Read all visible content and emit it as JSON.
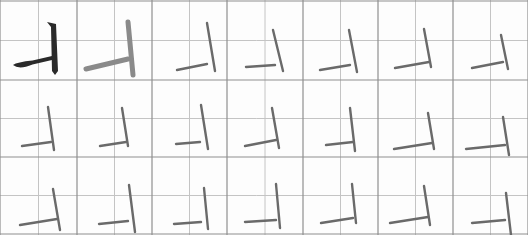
{
  "sheet": {
    "title": "Calligraphy stroke practice grid",
    "rows": 3,
    "cols": 7,
    "col_edges": [
      0,
      77,
      152,
      227,
      303,
      378,
      453,
      528
    ],
    "row_edges": [
      1,
      80,
      157,
      234
    ],
    "colors": {
      "grid_major": "#8f8f8f",
      "grid_minor": "#c4c4c4",
      "model_ink": "#2a2a2a",
      "trace_ink": "#8a8a8a",
      "practice_ink": "#6a6a6a"
    }
  },
  "cells": [
    {
      "row": 0,
      "col": 0,
      "kind": "model",
      "h": [
        [
          13,
          65
        ],
        [
          52,
          58
        ]
      ],
      "v": [
        [
          50,
          22
        ],
        [
          57,
          75
        ]
      ]
    },
    {
      "row": 0,
      "col": 1,
      "kind": "trace",
      "h": [
        [
          86,
          69
        ],
        [
          128,
          59
        ]
      ],
      "v": [
        [
          128,
          22
        ],
        [
          133,
          75
        ]
      ]
    },
    {
      "row": 0,
      "col": 2,
      "kind": "practice",
      "h": [
        [
          177,
          70
        ],
        [
          207,
          64
        ]
      ],
      "v": [
        [
          207,
          23
        ],
        [
          215,
          71
        ]
      ]
    },
    {
      "row": 0,
      "col": 3,
      "kind": "practice",
      "h": [
        [
          246,
          67
        ],
        [
          275,
          65
        ]
      ],
      "v": [
        [
          273,
          30
        ],
        [
          283,
          71
        ]
      ]
    },
    {
      "row": 0,
      "col": 4,
      "kind": "practice",
      "h": [
        [
          320,
          70
        ],
        [
          350,
          65
        ]
      ],
      "v": [
        [
          349,
          30
        ],
        [
          357,
          72
        ]
      ]
    },
    {
      "row": 0,
      "col": 5,
      "kind": "practice",
      "h": [
        [
          395,
          68
        ],
        [
          429,
          62
        ]
      ],
      "v": [
        [
          424,
          29
        ],
        [
          431,
          67
        ]
      ]
    },
    {
      "row": 0,
      "col": 6,
      "kind": "practice",
      "h": [
        [
          472,
          68
        ],
        [
          503,
          62
        ]
      ],
      "v": [
        [
          501,
          35
        ],
        [
          508,
          69
        ]
      ]
    },
    {
      "row": 1,
      "col": 0,
      "kind": "practice",
      "h": [
        [
          22,
          146
        ],
        [
          51,
          142
        ]
      ],
      "v": [
        [
          48,
          107
        ],
        [
          54,
          150
        ]
      ]
    },
    {
      "row": 1,
      "col": 1,
      "kind": "practice",
      "h": [
        [
          100,
          146
        ],
        [
          126,
          142
        ]
      ],
      "v": [
        [
          122,
          108
        ],
        [
          128,
          146
        ]
      ]
    },
    {
      "row": 1,
      "col": 2,
      "kind": "practice",
      "h": [
        [
          176,
          144
        ],
        [
          200,
          142
        ]
      ],
      "v": [
        [
          201,
          105
        ],
        [
          208,
          149
        ]
      ]
    },
    {
      "row": 1,
      "col": 3,
      "kind": "practice",
      "h": [
        [
          245,
          146
        ],
        [
          276,
          140
        ]
      ],
      "v": [
        [
          272,
          108
        ],
        [
          279,
          148
        ]
      ]
    },
    {
      "row": 1,
      "col": 4,
      "kind": "practice",
      "h": [
        [
          326,
          145
        ],
        [
          353,
          142
        ]
      ],
      "v": [
        [
          350,
          108
        ],
        [
          355,
          151
        ]
      ]
    },
    {
      "row": 1,
      "col": 5,
      "kind": "practice",
      "h": [
        [
          394,
          149
        ],
        [
          432,
          143
        ]
      ],
      "v": [
        [
          428,
          113
        ],
        [
          434,
          149
        ]
      ]
    },
    {
      "row": 1,
      "col": 6,
      "kind": "practice",
      "h": [
        [
          466,
          149
        ],
        [
          505,
          145
        ]
      ],
      "v": [
        [
          503,
          117
        ],
        [
          509,
          155
        ]
      ]
    },
    {
      "row": 2,
      "col": 0,
      "kind": "practice",
      "h": [
        [
          20,
          225
        ],
        [
          57,
          219
        ]
      ],
      "v": [
        [
          53,
          189
        ],
        [
          60,
          230
        ]
      ]
    },
    {
      "row": 2,
      "col": 1,
      "kind": "practice",
      "h": [
        [
          99,
          224
        ],
        [
          128,
          221
        ]
      ],
      "v": [
        [
          129,
          185
        ],
        [
          135,
          232
        ]
      ]
    },
    {
      "row": 2,
      "col": 2,
      "kind": "practice",
      "h": [
        [
          174,
          224
        ],
        [
          201,
          222
        ]
      ],
      "v": [
        [
          204,
          188
        ],
        [
          208,
          229
        ]
      ]
    },
    {
      "row": 2,
      "col": 3,
      "kind": "practice",
      "h": [
        [
          245,
          222
        ],
        [
          276,
          220
        ]
      ],
      "v": [
        [
          276,
          184
        ],
        [
          280,
          228
        ]
      ]
    },
    {
      "row": 2,
      "col": 4,
      "kind": "practice",
      "h": [
        [
          321,
          223
        ],
        [
          353,
          218
        ]
      ],
      "v": [
        [
          352,
          184
        ],
        [
          356,
          223
        ]
      ]
    },
    {
      "row": 2,
      "col": 5,
      "kind": "practice",
      "h": [
        [
          390,
          223
        ],
        [
          428,
          217
        ]
      ],
      "v": [
        [
          424,
          186
        ],
        [
          430,
          225
        ]
      ]
    },
    {
      "row": 2,
      "col": 6,
      "kind": "practice",
      "h": [
        [
          472,
          223
        ],
        [
          505,
          220
        ]
      ],
      "v": [
        [
          506,
          193
        ],
        [
          511,
          235
        ]
      ]
    }
  ]
}
